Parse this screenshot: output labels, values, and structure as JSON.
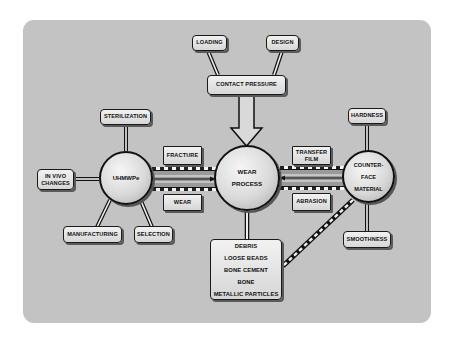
{
  "diagram": {
    "colors": {
      "background": "#c3c3c3",
      "node_fill": "#e2e2e2",
      "outline": "#111111",
      "page": "#ffffff"
    },
    "top_inputs": {
      "loading": "LOADING",
      "design": "DESIGN",
      "contact_pressure": "CONTACT PRESSURE"
    },
    "uhmwpe": {
      "label": "UHMWPe",
      "factors": {
        "sterilization": "STERILIZATION",
        "in_vivo_line1": "IN VIVO",
        "in_vivo_line2": "CHANGES",
        "manufacturing": "MANUFACTURING",
        "selection": "SELECTION"
      }
    },
    "left_links": {
      "top": "FRACTURE",
      "bottom": "WEAR"
    },
    "wear_process": {
      "line1": "WEAR",
      "line2": "PROCESS"
    },
    "right_links": {
      "top_line1": "TRANSFER",
      "top_line2": "FILM",
      "bottom": "ABRASION"
    },
    "counterface": {
      "line1": "COUNTER-",
      "line2": "FACE",
      "line3": "MATERIAL",
      "factors": {
        "hardness": "HARDNESS",
        "smoothness": "SMOOTHNESS"
      }
    },
    "debris": {
      "items": [
        "DEBRIS",
        "LOOSE BEADS",
        "BONE CEMENT",
        "BONE",
        "METALLIC PARTICLES"
      ]
    }
  }
}
